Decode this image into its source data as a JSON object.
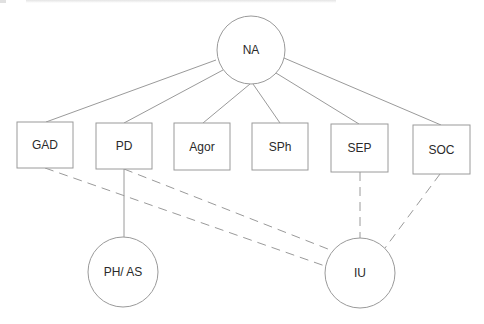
{
  "diagram": {
    "type": "network",
    "colors": {
      "stroke": "#9a9a9a",
      "text": "#2a2a2a",
      "background": "#ffffff"
    },
    "nodes": [
      {
        "id": "NA",
        "label": "NA",
        "shape": "circle",
        "cx": 251,
        "cy": 50,
        "r": 34
      },
      {
        "id": "GAD",
        "label": "GAD",
        "shape": "box",
        "x": 17,
        "y": 122,
        "w": 56,
        "h": 46
      },
      {
        "id": "PD",
        "label": "PD",
        "shape": "box",
        "x": 96,
        "y": 123,
        "w": 56,
        "h": 46
      },
      {
        "id": "Agor",
        "label": "Agor",
        "shape": "box",
        "x": 174,
        "y": 123,
        "w": 56,
        "h": 47
      },
      {
        "id": "SPh",
        "label": "SPh",
        "shape": "box",
        "x": 252,
        "y": 123,
        "w": 56,
        "h": 47
      },
      {
        "id": "SEP",
        "label": "SEP",
        "shape": "box",
        "x": 331,
        "y": 124,
        "w": 57,
        "h": 48
      },
      {
        "id": "SOC",
        "label": "SOC",
        "shape": "box",
        "x": 413,
        "y": 125,
        "w": 57,
        "h": 49
      },
      {
        "id": "PHAS",
        "label": "PH/ AS",
        "shape": "circle",
        "cx": 123,
        "cy": 272,
        "r": 35
      },
      {
        "id": "IU",
        "label": "IU",
        "shape": "circle",
        "cx": 360,
        "cy": 273,
        "r": 35
      }
    ],
    "edges": [
      {
        "from": "NA",
        "to": "GAD",
        "style": "solid",
        "x1": 216,
        "y1": 60,
        "x2": 46,
        "y2": 122
      },
      {
        "from": "NA",
        "to": "PD",
        "style": "solid",
        "x1": 223,
        "y1": 70,
        "x2": 124,
        "y2": 123
      },
      {
        "from": "NA",
        "to": "Agor",
        "style": "solid",
        "x1": 250,
        "y1": 84,
        "x2": 203,
        "y2": 123
      },
      {
        "from": "NA",
        "to": "SPh",
        "style": "solid",
        "x1": 253,
        "y1": 84,
        "x2": 280,
        "y2": 123
      },
      {
        "from": "NA",
        "to": "SEP",
        "style": "solid",
        "x1": 276,
        "y1": 73,
        "x2": 359,
        "y2": 124
      },
      {
        "from": "NA",
        "to": "SOC",
        "style": "solid",
        "x1": 284,
        "y1": 58,
        "x2": 441,
        "y2": 125
      },
      {
        "from": "PD",
        "to": "PHAS",
        "style": "solid",
        "x1": 124,
        "y1": 169,
        "x2": 124,
        "y2": 237
      },
      {
        "from": "GAD",
        "to": "IU",
        "style": "dashed",
        "x1": 45,
        "y1": 168,
        "x2": 325,
        "y2": 266
      },
      {
        "from": "PD",
        "to": "IU",
        "style": "dashed",
        "x1": 124,
        "y1": 169,
        "x2": 333,
        "y2": 251
      },
      {
        "from": "SEP",
        "to": "IU",
        "style": "dashed",
        "x1": 360,
        "y1": 172,
        "x2": 360,
        "y2": 238
      },
      {
        "from": "SOC",
        "to": "IU",
        "style": "dashed",
        "x1": 440,
        "y1": 174,
        "x2": 385,
        "y2": 248
      }
    ]
  }
}
